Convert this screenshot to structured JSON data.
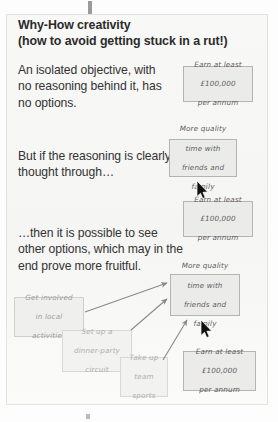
{
  "slide": {
    "headline_line_1": "Why-How creativity",
    "headline_line_2": "(how to avoid getting stuck in a rut!)",
    "paragraphs": [
      "An isolated objective, with no reasoning behind it, has no options.",
      "But if the reasoning is clearly thought through…",
      "…then it is possible to see other options, which may in the end prove more fruitful."
    ]
  },
  "notes": {
    "goal_1": {
      "line_1": "Earn at least",
      "line_2": "£100,000",
      "line_3": "per annum"
    },
    "goal_2": {
      "line_1": "Earn at least",
      "line_2": "£100,000",
      "line_3": "per annum"
    },
    "goal_3": {
      "line_1": "Earn at least",
      "line_2": "£100,000",
      "line_3": "per annum"
    },
    "quality_1": {
      "line_1": "More quality",
      "line_2": "time with",
      "line_3": "friends and",
      "line_4": "family"
    },
    "quality_2": {
      "line_1": "More quality",
      "line_2": "time with",
      "line_3": "friends and",
      "line_4": "family"
    },
    "involved": {
      "line_1": "Get involved",
      "line_2": "in local",
      "line_3": "activities"
    },
    "dinner": {
      "line_1": "Set up a",
      "line_2": "dinner-party",
      "line_3": "circuit"
    },
    "sports": {
      "line_1": "Take up",
      "line_2": "team",
      "line_3": "sports"
    }
  },
  "colors": {
    "page_background": "#fdfdfd",
    "slide_background": "#f7f7f6",
    "headline_text": "#2b2b2b",
    "body_text": "#333333",
    "note_fill": "#e9e9e7",
    "note_border": "#bfbfbd",
    "note_text": "#6d6d6b",
    "arrow": "#8a8a88",
    "cursor": "#111111",
    "tick_mark": "#9b9b9b"
  }
}
